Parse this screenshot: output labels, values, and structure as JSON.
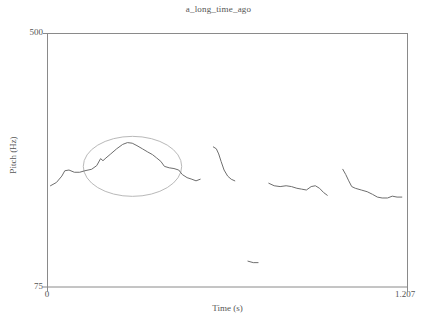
{
  "chart_data": {
    "type": "line",
    "title": "a_long_time_ago",
    "xlabel": "Time (s)",
    "ylabel": "Pitch (Hz)",
    "xlim": [
      0,
      1.207
    ],
    "ylim": [
      75,
      500
    ],
    "xticks": [
      "0",
      "1.207"
    ],
    "yticks": [
      "500",
      "75"
    ],
    "grid": false,
    "legend": "none",
    "y_scale_note": "logarithmic pitch scale (Praat style)",
    "series": [
      {
        "name": "pitch-contour-segment-1",
        "points": [
          [
            0.01,
            160
          ],
          [
            0.03,
            164
          ],
          [
            0.048,
            172
          ],
          [
            0.058,
            179
          ],
          [
            0.072,
            180
          ],
          [
            0.09,
            177
          ],
          [
            0.108,
            177
          ],
          [
            0.125,
            179
          ],
          [
            0.148,
            181
          ],
          [
            0.165,
            186
          ],
          [
            0.178,
            196
          ],
          [
            0.186,
            193
          ],
          [
            0.196,
            197
          ],
          [
            0.212,
            203
          ],
          [
            0.232,
            211
          ],
          [
            0.252,
            218
          ],
          [
            0.268,
            221
          ],
          [
            0.284,
            220
          ],
          [
            0.3,
            216
          ],
          [
            0.318,
            211
          ],
          [
            0.336,
            206
          ],
          [
            0.352,
            202
          ],
          [
            0.366,
            197
          ],
          [
            0.38,
            192
          ],
          [
            0.392,
            185
          ],
          [
            0.408,
            183
          ],
          [
            0.424,
            182
          ],
          [
            0.44,
            180
          ],
          [
            0.452,
            174
          ],
          [
            0.468,
            170
          ],
          [
            0.484,
            168
          ],
          [
            0.498,
            166
          ],
          [
            0.512,
            168
          ]
        ]
      },
      {
        "name": "pitch-contour-segment-2",
        "points": [
          [
            0.556,
            214
          ],
          [
            0.566,
            211
          ],
          [
            0.574,
            203
          ],
          [
            0.582,
            192
          ],
          [
            0.592,
            180
          ],
          [
            0.604,
            172
          ],
          [
            0.616,
            168
          ],
          [
            0.628,
            166
          ]
        ]
      },
      {
        "name": "pitch-contour-segment-3-low",
        "points": [
          [
            0.672,
            91
          ],
          [
            0.69,
            90
          ],
          [
            0.706,
            90
          ]
        ]
      },
      {
        "name": "pitch-contour-segment-4",
        "points": [
          [
            0.742,
            163
          ],
          [
            0.76,
            160
          ],
          [
            0.78,
            159
          ],
          [
            0.8,
            160
          ],
          [
            0.818,
            159
          ],
          [
            0.836,
            157
          ],
          [
            0.852,
            156
          ],
          [
            0.868,
            155
          ],
          [
            0.884,
            159
          ],
          [
            0.898,
            160
          ],
          [
            0.912,
            157
          ],
          [
            0.926,
            152
          ],
          [
            0.938,
            149
          ]
        ]
      },
      {
        "name": "pitch-contour-segment-5",
        "points": [
          [
            0.99,
            181
          ],
          [
            1.0,
            174
          ],
          [
            1.01,
            166
          ],
          [
            1.02,
            159
          ],
          [
            1.032,
            157
          ],
          [
            1.052,
            155
          ],
          [
            1.072,
            153
          ],
          [
            1.09,
            150
          ],
          [
            1.106,
            147
          ],
          [
            1.122,
            146
          ],
          [
            1.14,
            146
          ],
          [
            1.156,
            148
          ],
          [
            1.172,
            147
          ],
          [
            1.188,
            147
          ]
        ]
      }
    ],
    "annotations": [
      {
        "name": "highlight-ellipse",
        "shape": "ellipse",
        "center_time": 0.285,
        "center_pitch": 185,
        "time_radius": 0.165,
        "note": "grey ellipse highlighting the rise-fall pitch accent"
      }
    ]
  }
}
